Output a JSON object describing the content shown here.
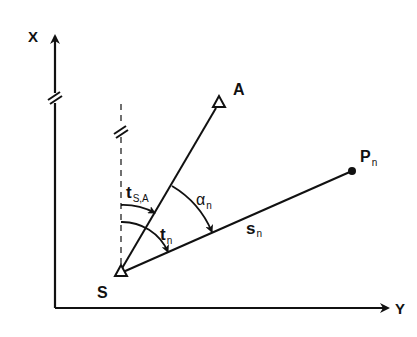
{
  "diagram": {
    "axes": {
      "x_label": "X",
      "y_label": "Y"
    },
    "points": {
      "station": {
        "label": "S"
      },
      "reference": {
        "label": "A"
      },
      "target": {
        "label": "P",
        "subscript": "n"
      }
    },
    "angles": {
      "orientation": {
        "label": "t",
        "subscript": "S,A"
      },
      "direction": {
        "label": "t",
        "subscript": "n"
      },
      "alpha": {
        "label": "α",
        "subscript": "n"
      }
    },
    "distance": {
      "label": "s",
      "subscript": "n"
    },
    "colors": {
      "ink": "#111111",
      "background": "#ffffff"
    }
  }
}
